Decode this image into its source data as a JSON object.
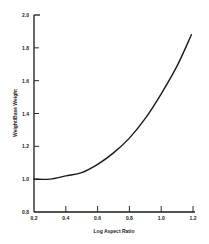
{
  "chart_data": {
    "type": "line",
    "title": "",
    "xlabel": "Log Aspect Ratio",
    "ylabel": "Weight/Base Weight",
    "xlim": [
      0.2,
      1.2
    ],
    "ylim": [
      0.8,
      2.0
    ],
    "x_ticks": [
      "0.2",
      "0.4",
      "0.6",
      "0.8",
      "1.0",
      "1.2"
    ],
    "y_ticks": [
      "0.8",
      "1.0",
      "1.2",
      "1.4",
      "1.6",
      "1.8",
      "2.0"
    ],
    "grid": false,
    "legend": null,
    "series": [
      {
        "name": "Weight/Base Weight",
        "x": [
          0.2,
          0.3,
          0.4,
          0.5,
          0.6,
          0.7,
          0.8,
          0.9,
          1.0,
          1.1,
          1.19
        ],
        "y": [
          1.0,
          1.0,
          1.02,
          1.04,
          1.09,
          1.16,
          1.25,
          1.37,
          1.52,
          1.69,
          1.88
        ]
      }
    ]
  },
  "colors": {
    "line": "#1a1a1a",
    "axis": "#1a1a1a",
    "text": "#222222",
    "background": "#ffffff"
  }
}
